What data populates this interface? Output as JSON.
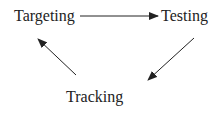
{
  "diagram": {
    "type": "cycle",
    "nodes": [
      {
        "id": "targeting",
        "label": "Targeting"
      },
      {
        "id": "testing",
        "label": "Testing"
      },
      {
        "id": "tracking",
        "label": "Tracking"
      }
    ],
    "edges": [
      {
        "from": "targeting",
        "to": "testing"
      },
      {
        "from": "testing",
        "to": "tracking"
      },
      {
        "from": "tracking",
        "to": "targeting"
      }
    ],
    "colors": {
      "text": "#222222",
      "arrow": "#222222",
      "background": "#ffffff"
    }
  }
}
